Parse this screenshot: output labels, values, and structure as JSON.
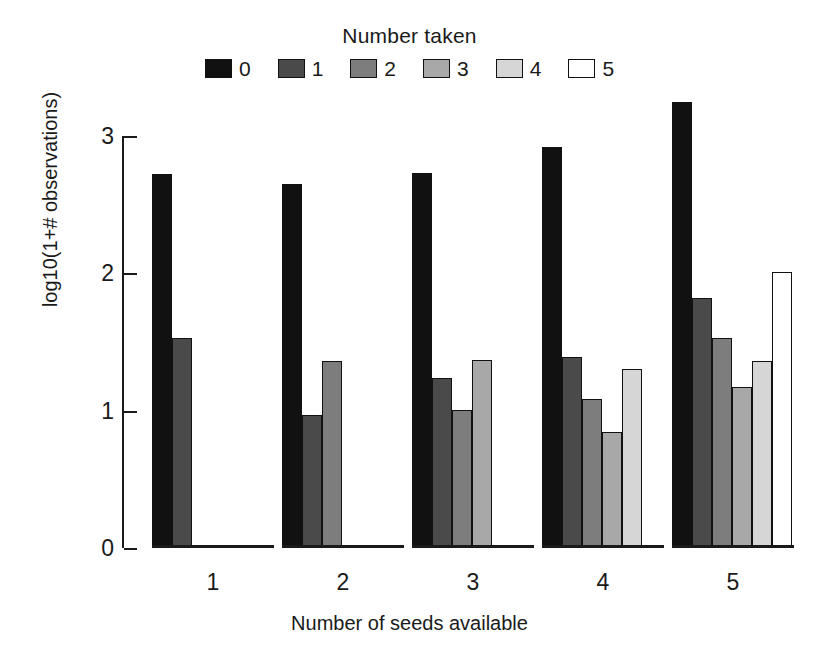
{
  "chart_data": {
    "type": "bar",
    "title": "",
    "legend_title": "Number taken",
    "legend_position": "top-center",
    "xlabel": "Number of seeds available",
    "ylabel": "log10(1+# observations)",
    "categories": [
      "1",
      "2",
      "3",
      "4",
      "5"
    ],
    "series": [
      {
        "name": "0",
        "color": "#111111",
        "values": [
          2.7,
          2.63,
          2.71,
          2.9,
          3.23
        ]
      },
      {
        "name": "1",
        "color": "#4a4a4a",
        "values": [
          1.51,
          0.95,
          1.22,
          1.37,
          1.8
        ]
      },
      {
        "name": "2",
        "color": "#7d7d7d",
        "values": [
          0.0,
          1.34,
          0.98,
          1.06,
          1.51
        ]
      },
      {
        "name": "3",
        "color": "#a8a8a8",
        "values": [
          0.0,
          0.0,
          1.35,
          0.82,
          1.15
        ]
      },
      {
        "name": "4",
        "color": "#d6d6d6",
        "values": [
          0.0,
          0.0,
          0.0,
          1.28,
          1.34
        ]
      },
      {
        "name": "5",
        "color": "#ffffff",
        "values": [
          0.0,
          0.0,
          0.0,
          0.0,
          1.99
        ]
      }
    ],
    "yticks": [
      0,
      1,
      2,
      3
    ],
    "ytick_labels": [
      "0",
      "1",
      "2",
      "3"
    ],
    "ylim": [
      0,
      3.3
    ],
    "grid": false
  },
  "legend": {
    "title": "Number taken",
    "entries": [
      {
        "label": "0",
        "color": "#111111"
      },
      {
        "label": "1",
        "color": "#4a4a4a"
      },
      {
        "label": "2",
        "color": "#7d7d7d"
      },
      {
        "label": "3",
        "color": "#a8a8a8"
      },
      {
        "label": "4",
        "color": "#d6d6d6"
      },
      {
        "label": "5",
        "color": "#ffffff"
      }
    ]
  },
  "axes": {
    "x_title": "Number of seeds available",
    "y_title": "log10(1+# observations)"
  }
}
